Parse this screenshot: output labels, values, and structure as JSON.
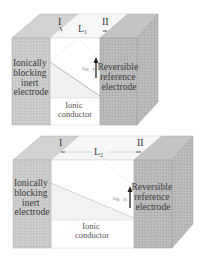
{
  "diagram": {
    "panels": [
      {
        "id": "top",
        "label_I": "I",
        "label_II": "II",
        "length_label": "L",
        "length_subscript": "1",
        "left_electrode": [
          "Ionically",
          "blocking",
          "inert",
          "electrode"
        ],
        "right_electrode": [
          "Reversible",
          "reference",
          "electrode"
        ],
        "conductor": [
          "Ionic",
          "conductor"
        ],
        "concentration_label": "c",
        "concentration_subscript": "M(+, II)"
      },
      {
        "id": "bottom",
        "label_I": "I",
        "label_II": "II",
        "length_label": "L",
        "length_subscript": "2",
        "left_electrode": [
          "Ionically",
          "blocking",
          "inert",
          "electrode"
        ],
        "right_electrode": [
          "Reversible",
          "reference",
          "electrode"
        ],
        "conductor": [
          "Ionic",
          "conductor"
        ],
        "concentration_label": "c",
        "concentration_subscript": "M(+, II)"
      }
    ],
    "colors": {
      "electrode_front": "#c9c9c9",
      "electrode_top": "#d6d6d6",
      "electrode_side": "#bdbdbd",
      "conductor": "#ffffff",
      "lines": "#9a9a9a",
      "arrow": "#222222"
    }
  }
}
